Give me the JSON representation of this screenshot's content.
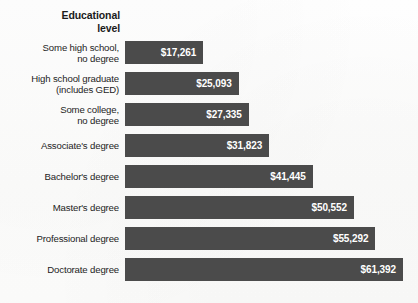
{
  "chart_data": {
    "type": "bar",
    "orientation": "horizontal",
    "title": "Educational level",
    "title_lines": [
      "Educational",
      "level"
    ],
    "xlabel": "",
    "ylabel": "Educational level",
    "grid": false,
    "legend": false,
    "axis_visible": false,
    "value_prefix": "$",
    "xlim": [
      0,
      61392
    ],
    "categories": [
      "Some high school, no degree",
      "High school graduate (includes GED)",
      "Some college, no degree",
      "Associate's degree",
      "Bachelor's degree",
      "Master's degree",
      "Professional degree",
      "Doctorate degree"
    ],
    "values": [
      17261,
      25093,
      27335,
      31823,
      41445,
      50552,
      55292,
      61392
    ],
    "value_labels": [
      "$17,261",
      "$25,093",
      "$27,335",
      "$31,823",
      "$41,445",
      "$50,552",
      "$55,292",
      "$61,392"
    ],
    "category_label_lines": [
      [
        "Some high school,",
        "no degree"
      ],
      [
        "High school graduate",
        "(includes GED)"
      ],
      [
        "Some college,",
        "no degree"
      ],
      [
        "Associate's degree"
      ],
      [
        "Bachelor's degree"
      ],
      [
        "Master's degree"
      ],
      [
        "Professional degree"
      ],
      [
        "Doctorate degree"
      ]
    ],
    "colors": {
      "bar": "#4b4b4b",
      "value_text": "#ffffff",
      "category_text": "#1d1d1d",
      "title_text": "#1a1a1a",
      "background": "#fdfdfd"
    },
    "geometry": {
      "bar_origin_x": 125,
      "bar_max_width": 278,
      "bar_height": 23,
      "row_pitch": 31,
      "first_row_top": 41
    }
  }
}
